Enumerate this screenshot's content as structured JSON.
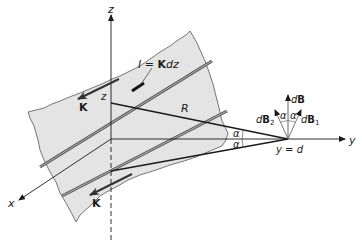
{
  "figure": {
    "colors": {
      "sheet_fill": "#e4e4e4",
      "sheet_edge": "#555555",
      "axis": "#1a1a1a",
      "strip": "#555555",
      "text": "#1a1a1a"
    }
  },
  "axes": {
    "z_label": "z",
    "y_label": "y",
    "x_label": "x"
  },
  "labels": {
    "current_element": "I = Kdz",
    "current_element_parts": {
      "I": "I",
      "eq": " = ",
      "K": "K",
      "dz": "dz"
    },
    "K_upper": "K",
    "K_lower": "K",
    "z_point": "z",
    "R": "R",
    "alpha_1": "α",
    "alpha_2": "α",
    "alpha_3": "α",
    "alpha_4": "α",
    "dB": {
      "d": "d",
      "B": "B"
    },
    "dB1": {
      "d": "d",
      "B": "B",
      "sub": "1"
    },
    "dB2": {
      "d": "d",
      "B": "B",
      "sub": "2"
    },
    "field_point": "y = d"
  }
}
